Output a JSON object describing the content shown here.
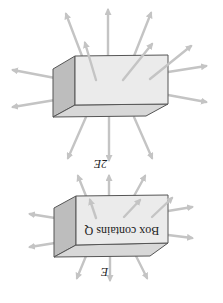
{
  "figure": {
    "orientation": "rotated 180 degrees",
    "panels": [
      {
        "id": "box-contains-2Q",
        "field_label": "2E⃗",
        "box_label": "",
        "arrow_count": 14,
        "arrow_density": "high"
      },
      {
        "id": "box-contains-Q",
        "field_label": "E⃗",
        "box_label": "Box contains Q",
        "arrow_count": 11,
        "arrow_density": "low"
      }
    ]
  },
  "colors": {
    "arrow": "#c4c4c4",
    "box_front": "#ebebeb",
    "box_side": "#bdbdbd",
    "box_bottom": "#d8d8d8",
    "edge": "#555555"
  }
}
